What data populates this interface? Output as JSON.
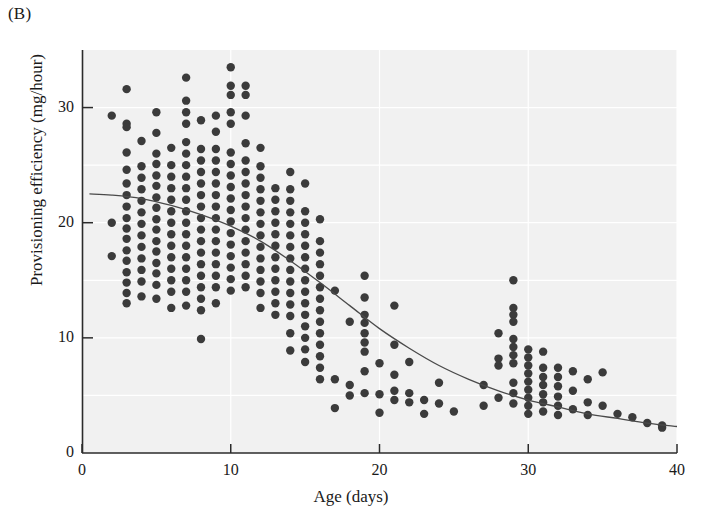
{
  "panel": {
    "label": "(B)"
  },
  "chart_data": {
    "type": "scatter",
    "title": "",
    "subtitle": "",
    "xlabel": "Age (days)",
    "ylabel": "Provisioning efficiency (mg/hour)",
    "xlim": [
      0,
      40
    ],
    "ylim": [
      0,
      35
    ],
    "xticks": [
      0,
      10,
      20,
      30,
      40
    ],
    "yticks": [
      0,
      10,
      20,
      30
    ],
    "xtick_labels": [
      "0",
      "10",
      "20",
      "30",
      "40"
    ],
    "ytick_labels": [
      "0",
      "10",
      "20",
      "30"
    ],
    "grid": true,
    "grid_color": "#ffffff",
    "plot_background": "#f1f1f1",
    "legend": null,
    "legend_position": "none",
    "marker_color": "#3b3b3b",
    "marker_size": 6,
    "marker_shape": "circle",
    "annotations": [],
    "series": [
      {
        "name": "Observations",
        "type": "scatter",
        "points": [
          [
            2,
            29.3
          ],
          [
            2,
            20.0
          ],
          [
            2,
            17.1
          ],
          [
            3,
            31.6
          ],
          [
            3,
            28.6
          ],
          [
            3,
            28.3
          ],
          [
            3,
            26.1
          ],
          [
            3,
            24.6
          ],
          [
            3,
            23.4
          ],
          [
            3,
            22.4
          ],
          [
            3,
            21.4
          ],
          [
            3,
            20.4
          ],
          [
            3,
            19.5
          ],
          [
            3,
            18.6
          ],
          [
            3,
            17.6
          ],
          [
            3,
            16.7
          ],
          [
            3,
            15.7
          ],
          [
            3,
            14.8
          ],
          [
            3,
            13.9
          ],
          [
            3,
            13.0
          ],
          [
            4,
            27.1
          ],
          [
            4,
            24.9
          ],
          [
            4,
            23.9
          ],
          [
            4,
            22.9
          ],
          [
            4,
            21.9
          ],
          [
            4,
            20.9
          ],
          [
            4,
            19.9
          ],
          [
            4,
            18.9
          ],
          [
            4,
            17.9
          ],
          [
            4,
            16.9
          ],
          [
            4,
            15.9
          ],
          [
            4,
            14.9
          ],
          [
            4,
            13.6
          ],
          [
            5,
            29.6
          ],
          [
            5,
            27.8
          ],
          [
            5,
            26.0
          ],
          [
            5,
            25.1
          ],
          [
            5,
            24.1
          ],
          [
            5,
            23.2
          ],
          [
            5,
            22.2
          ],
          [
            5,
            21.3
          ],
          [
            5,
            20.3
          ],
          [
            5,
            19.4
          ],
          [
            5,
            18.4
          ],
          [
            5,
            17.5
          ],
          [
            5,
            16.5
          ],
          [
            5,
            15.6
          ],
          [
            5,
            14.6
          ],
          [
            5,
            13.4
          ],
          [
            6,
            26.5
          ],
          [
            6,
            25.0
          ],
          [
            6,
            24.0
          ],
          [
            6,
            23.0
          ],
          [
            6,
            22.0
          ],
          [
            6,
            21.0
          ],
          [
            6,
            20.0
          ],
          [
            6,
            19.0
          ],
          [
            6,
            18.0
          ],
          [
            6,
            17.0
          ],
          [
            6,
            16.0
          ],
          [
            6,
            15.0
          ],
          [
            6,
            14.0
          ],
          [
            6,
            12.6
          ],
          [
            7,
            32.6
          ],
          [
            7,
            30.6
          ],
          [
            7,
            29.6
          ],
          [
            7,
            28.6
          ],
          [
            7,
            27.0
          ],
          [
            7,
            26.0
          ],
          [
            7,
            25.0
          ],
          [
            7,
            24.0
          ],
          [
            7,
            23.0
          ],
          [
            7,
            22.0
          ],
          [
            7,
            21.0
          ],
          [
            7,
            20.0
          ],
          [
            7,
            19.0
          ],
          [
            7,
            18.0
          ],
          [
            7,
            17.0
          ],
          [
            7,
            16.0
          ],
          [
            7,
            15.0
          ],
          [
            7,
            14.0
          ],
          [
            7,
            12.8
          ],
          [
            8,
            28.9
          ],
          [
            8,
            26.4
          ],
          [
            8,
            25.4
          ],
          [
            8,
            24.4
          ],
          [
            8,
            23.4
          ],
          [
            8,
            22.4
          ],
          [
            8,
            21.4
          ],
          [
            8,
            20.4
          ],
          [
            8,
            19.4
          ],
          [
            8,
            18.4
          ],
          [
            8,
            17.4
          ],
          [
            8,
            16.4
          ],
          [
            8,
            15.4
          ],
          [
            8,
            14.4
          ],
          [
            8,
            13.4
          ],
          [
            8,
            12.4
          ],
          [
            8,
            9.9
          ],
          [
            9,
            29.3
          ],
          [
            9,
            27.9
          ],
          [
            9,
            26.4
          ],
          [
            9,
            25.4
          ],
          [
            9,
            24.4
          ],
          [
            9,
            23.4
          ],
          [
            9,
            22.4
          ],
          [
            9,
            21.4
          ],
          [
            9,
            20.4
          ],
          [
            9,
            19.4
          ],
          [
            9,
            18.4
          ],
          [
            9,
            17.4
          ],
          [
            9,
            16.4
          ],
          [
            9,
            15.4
          ],
          [
            9,
            14.4
          ],
          [
            9,
            13.0
          ],
          [
            10,
            33.5
          ],
          [
            10,
            31.9
          ],
          [
            10,
            31.1
          ],
          [
            10,
            29.6
          ],
          [
            10,
            28.6
          ],
          [
            10,
            26.1
          ],
          [
            10,
            25.1
          ],
          [
            10,
            24.1
          ],
          [
            10,
            23.1
          ],
          [
            10,
            22.1
          ],
          [
            10,
            21.1
          ],
          [
            10,
            20.1
          ],
          [
            10,
            19.1
          ],
          [
            10,
            18.1
          ],
          [
            10,
            17.1
          ],
          [
            10,
            16.1
          ],
          [
            10,
            15.1
          ],
          [
            10,
            14.1
          ],
          [
            11,
            31.9
          ],
          [
            11,
            31.1
          ],
          [
            11,
            29.3
          ],
          [
            11,
            26.9
          ],
          [
            11,
            25.4
          ],
          [
            11,
            24.4
          ],
          [
            11,
            23.4
          ],
          [
            11,
            22.4
          ],
          [
            11,
            21.4
          ],
          [
            11,
            20.4
          ],
          [
            11,
            19.4
          ],
          [
            11,
            18.4
          ],
          [
            11,
            17.4
          ],
          [
            11,
            16.4
          ],
          [
            11,
            15.4
          ],
          [
            11,
            14.4
          ],
          [
            12,
            26.5
          ],
          [
            12,
            24.9
          ],
          [
            12,
            23.9
          ],
          [
            12,
            22.9
          ],
          [
            12,
            21.9
          ],
          [
            12,
            20.9
          ],
          [
            12,
            19.9
          ],
          [
            12,
            18.9
          ],
          [
            12,
            17.9
          ],
          [
            12,
            16.9
          ],
          [
            12,
            15.9
          ],
          [
            12,
            14.9
          ],
          [
            12,
            13.9
          ],
          [
            12,
            12.6
          ],
          [
            13,
            23.0
          ],
          [
            13,
            22.0
          ],
          [
            13,
            21.0
          ],
          [
            13,
            20.0
          ],
          [
            13,
            19.0
          ],
          [
            13,
            18.0
          ],
          [
            13,
            17.0
          ],
          [
            13,
            16.0
          ],
          [
            13,
            15.0
          ],
          [
            13,
            14.0
          ],
          [
            13,
            13.0
          ],
          [
            13,
            12.0
          ],
          [
            14,
            24.4
          ],
          [
            14,
            22.9
          ],
          [
            14,
            21.9
          ],
          [
            14,
            20.9
          ],
          [
            14,
            19.9
          ],
          [
            14,
            18.9
          ],
          [
            14,
            17.9
          ],
          [
            14,
            16.9
          ],
          [
            14,
            15.9
          ],
          [
            14,
            14.9
          ],
          [
            14,
            13.9
          ],
          [
            14,
            12.9
          ],
          [
            14,
            11.9
          ],
          [
            14,
            10.4
          ],
          [
            14,
            8.9
          ],
          [
            15,
            23.4
          ],
          [
            15,
            21.0
          ],
          [
            15,
            20.0
          ],
          [
            15,
            19.0
          ],
          [
            15,
            18.0
          ],
          [
            15,
            17.0
          ],
          [
            15,
            16.0
          ],
          [
            15,
            15.0
          ],
          [
            15,
            14.0
          ],
          [
            15,
            13.0
          ],
          [
            15,
            12.0
          ],
          [
            15,
            11.0
          ],
          [
            15,
            10.0
          ],
          [
            15,
            9.0
          ],
          [
            15,
            7.9
          ],
          [
            16,
            20.3
          ],
          [
            16,
            18.4
          ],
          [
            16,
            17.4
          ],
          [
            16,
            16.4
          ],
          [
            16,
            15.4
          ],
          [
            16,
            14.4
          ],
          [
            16,
            13.4
          ],
          [
            16,
            12.4
          ],
          [
            16,
            11.4
          ],
          [
            16,
            10.4
          ],
          [
            16,
            9.4
          ],
          [
            16,
            8.4
          ],
          [
            16,
            7.4
          ],
          [
            16,
            6.4
          ],
          [
            17,
            14.1
          ],
          [
            17,
            6.4
          ],
          [
            17,
            3.9
          ],
          [
            18,
            11.4
          ],
          [
            18,
            5.9
          ],
          [
            18,
            5.0
          ],
          [
            19,
            15.4
          ],
          [
            19,
            13.5
          ],
          [
            19,
            12.0
          ],
          [
            19,
            11.3
          ],
          [
            19,
            10.4
          ],
          [
            19,
            9.6
          ],
          [
            19,
            8.8
          ],
          [
            19,
            7.1
          ],
          [
            19,
            5.2
          ],
          [
            20,
            7.8
          ],
          [
            20,
            5.1
          ],
          [
            20,
            3.5
          ],
          [
            21,
            12.8
          ],
          [
            21,
            9.4
          ],
          [
            21,
            6.8
          ],
          [
            21,
            5.4
          ],
          [
            21,
            4.6
          ],
          [
            22,
            7.9
          ],
          [
            22,
            5.2
          ],
          [
            22,
            4.4
          ],
          [
            23,
            4.6
          ],
          [
            23,
            3.4
          ],
          [
            24,
            6.1
          ],
          [
            24,
            4.3
          ],
          [
            25,
            3.6
          ],
          [
            27,
            5.9
          ],
          [
            27,
            4.1
          ],
          [
            28,
            10.4
          ],
          [
            28,
            8.2
          ],
          [
            28,
            7.6
          ],
          [
            28,
            4.8
          ],
          [
            29,
            15.0
          ],
          [
            29,
            12.6
          ],
          [
            29,
            12.0
          ],
          [
            29,
            11.4
          ],
          [
            29,
            9.9
          ],
          [
            29,
            9.2
          ],
          [
            29,
            8.5
          ],
          [
            29,
            7.8
          ],
          [
            29,
            6.1
          ],
          [
            29,
            5.2
          ],
          [
            29,
            4.3
          ],
          [
            30,
            9.0
          ],
          [
            30,
            8.3
          ],
          [
            30,
            7.6
          ],
          [
            30,
            6.9
          ],
          [
            30,
            6.2
          ],
          [
            30,
            5.5
          ],
          [
            30,
            4.8
          ],
          [
            30,
            4.1
          ],
          [
            30,
            3.4
          ],
          [
            31,
            8.8
          ],
          [
            31,
            7.4
          ],
          [
            31,
            6.6
          ],
          [
            31,
            5.9
          ],
          [
            31,
            5.1
          ],
          [
            31,
            4.4
          ],
          [
            31,
            3.6
          ],
          [
            32,
            7.4
          ],
          [
            32,
            6.6
          ],
          [
            32,
            5.8
          ],
          [
            32,
            4.9
          ],
          [
            32,
            4.1
          ],
          [
            32,
            3.3
          ],
          [
            33,
            7.1
          ],
          [
            33,
            5.4
          ],
          [
            33,
            3.8
          ],
          [
            34,
            6.4
          ],
          [
            34,
            4.4
          ],
          [
            34,
            3.3
          ],
          [
            35,
            7.0
          ],
          [
            35,
            4.1
          ],
          [
            36,
            3.4
          ],
          [
            37,
            3.1
          ],
          [
            38,
            2.6
          ],
          [
            39,
            2.4
          ],
          [
            39,
            2.2
          ]
        ]
      },
      {
        "name": "Fitted curve",
        "type": "line",
        "color": "#4a4a4a",
        "width": 1.3,
        "points": [
          [
            0.5,
            22.5
          ],
          [
            2,
            22.4
          ],
          [
            4,
            22.1
          ],
          [
            6,
            21.5
          ],
          [
            8,
            20.7
          ],
          [
            10,
            19.7
          ],
          [
            12,
            18.4
          ],
          [
            14,
            16.7
          ],
          [
            16,
            14.8
          ],
          [
            18,
            12.8
          ],
          [
            20,
            10.8
          ],
          [
            22,
            9.1
          ],
          [
            24,
            7.6
          ],
          [
            26,
            6.4
          ],
          [
            28,
            5.4
          ],
          [
            30,
            4.6
          ],
          [
            32,
            4.0
          ],
          [
            34,
            3.4
          ],
          [
            36,
            3.0
          ],
          [
            38,
            2.6
          ],
          [
            40,
            2.3
          ]
        ]
      }
    ]
  }
}
